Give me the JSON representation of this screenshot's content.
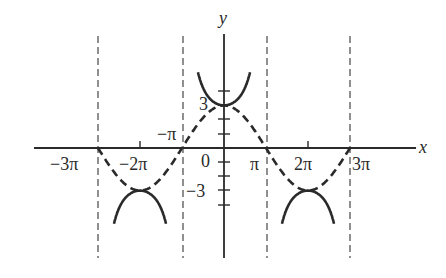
{
  "chart_data": {
    "type": "line",
    "title": "",
    "xlabel": "x",
    "ylabel": "y",
    "xlim_units_pi": [
      -3.4,
      3.6
    ],
    "ylim": [
      -7.8,
      10.5
    ],
    "grid": false,
    "x_tick_labels": [
      "−3π",
      "−2π",
      "π",
      "2π",
      "3π"
    ],
    "x_tick_values_pi": [
      -3,
      -2,
      1,
      2,
      3
    ],
    "y_tick_labels": [
      "3",
      "0",
      "−3"
    ],
    "y_tick_values": [
      3,
      0,
      -3
    ],
    "extra_labels": [
      "−π"
    ],
    "origin_label": "0",
    "series": [
      {
        "name": "y = 3 sec(x/2)",
        "style": "solid",
        "description": "U-shaped branches opening up from (0,3) and down from (±2π,−3)"
      },
      {
        "name": "y = 3 cos(x/2)",
        "style": "dashed",
        "description": "max 3 at x=0, min −3 at x=±2π, zeros at ±π, ±3π"
      },
      {
        "name": "asymptotes",
        "style": "dashed-thin",
        "x_values_pi": [
          -3,
          -1,
          1,
          3
        ]
      }
    ],
    "key_points": [
      {
        "x": "0",
        "y": 3
      },
      {
        "x": "-2π",
        "y": -3
      },
      {
        "x": "2π",
        "y": -3
      },
      {
        "x": "-3π",
        "y": 0
      },
      {
        "x": "-π",
        "y": 0
      },
      {
        "x": "π",
        "y": 0
      },
      {
        "x": "3π",
        "y": 0
      }
    ]
  },
  "labels": {
    "x_axis": "x",
    "y_axis": "y",
    "neg_3pi": "−3π",
    "neg_2pi": "−2π",
    "neg_pi": "−π",
    "pi": "π",
    "two_pi": "2π",
    "three_pi": "3π",
    "zero": "0",
    "three": "3",
    "neg_three": "−3"
  },
  "colors": {
    "ink": "#2a2a2a",
    "asymptote": "#555555",
    "background": "#ffffff"
  }
}
